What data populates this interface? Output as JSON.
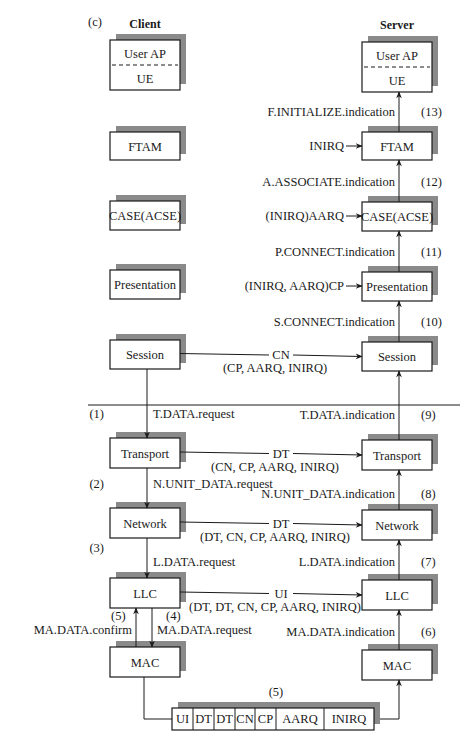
{
  "figure_label": "(c)",
  "columns": {
    "client": {
      "title": "Client",
      "x": 110,
      "w": 70
    },
    "server": {
      "title": "Server",
      "x": 362,
      "w": 70
    }
  },
  "layers": [
    {
      "id": "user-ap",
      "label": "User AP",
      "sub": "UE",
      "cy": 40,
      "sy": 42,
      "h": 50
    },
    {
      "id": "ftam",
      "label": "FTAM",
      "cy": 132,
      "sy": 132,
      "h": 28
    },
    {
      "id": "case",
      "label": "CASE(ACSE)",
      "cy": 201,
      "sy": 202,
      "h": 29
    },
    {
      "id": "presentation",
      "label": "Presentation",
      "cy": 270,
      "sy": 272,
      "h": 29
    },
    {
      "id": "session",
      "label": "Session",
      "cy": 340,
      "sy": 342,
      "h": 29
    },
    {
      "id": "transport",
      "label": "Transport",
      "cy": 438,
      "sy": 440,
      "h": 30
    },
    {
      "id": "network",
      "label": "Network",
      "cy": 508,
      "sy": 510,
      "h": 30
    },
    {
      "id": "llc",
      "label": "LLC",
      "cy": 578,
      "sy": 580,
      "h": 30
    },
    {
      "id": "mac",
      "label": "MAC",
      "cy": 647,
      "sy": 650,
      "h": 30
    }
  ],
  "server_primitives": [
    {
      "label": "F.INITIALIZE.indication",
      "step": "(13)",
      "y": 116
    },
    {
      "label": "A.ASSOCIATE.indication",
      "step": "(12)",
      "y": 186
    },
    {
      "label": "P.CONNECT.indication",
      "step": "(11)",
      "y": 256
    },
    {
      "label": "S.CONNECT.indication",
      "step": "(10)",
      "y": 326
    },
    {
      "label": "T.DATA.indication",
      "step": "(9)",
      "y": 419
    },
    {
      "label": "N.UNIT_DATA.indication",
      "step": "(8)",
      "y": 498
    },
    {
      "label": "L.DATA.indication",
      "step": "(7)",
      "y": 566
    },
    {
      "label": "MA.DATA.indication",
      "step": "(6)",
      "y": 636
    }
  ],
  "server_inputs": [
    {
      "label": "INIRQ",
      "layer": "ftam",
      "y": 150
    },
    {
      "label": "(INIRQ)AARQ",
      "layer": "case",
      "y": 220
    },
    {
      "label": "(INIRQ, AARQ)CP",
      "layer": "presentation",
      "y": 290
    }
  ],
  "client_primitives": [
    {
      "label": "T.DATA.request",
      "step": "(1)",
      "y": 418
    },
    {
      "label": "N.UNIT_DATA.request",
      "step": "(2)",
      "y": 488
    },
    {
      "label": "L.DATA.request",
      "step": "(3)",
      "y": 566
    }
  ],
  "mac_primitives": {
    "confirm": {
      "label": "MA.DATA.confirm",
      "step": "(5)"
    },
    "request": {
      "label": "MA.DATA.request",
      "step": "(4)"
    }
  },
  "peer_pdus": [
    {
      "layer": "session",
      "pdu": "CN",
      "contents": "(CP, AARQ, INIRQ)"
    },
    {
      "layer": "transport",
      "pdu": "DT",
      "contents": "(CN, CP, AARQ, INIRQ)"
    },
    {
      "layer": "network",
      "pdu": "DT",
      "contents": "(DT, CN, CP, AARQ, INIRQ)"
    },
    {
      "layer": "llc",
      "pdu": "UI",
      "contents": "(DT, DT, CN, CP, AARQ, INIRQ)"
    }
  ],
  "frame": {
    "step": "(5)",
    "fields": [
      "UI",
      "DT",
      "DT",
      "CN",
      "CP",
      "AARQ",
      "INIRQ"
    ],
    "widths": [
      21,
      21,
      21,
      20,
      21,
      48,
      50
    ]
  },
  "colors": {
    "ink": "#1a1a1a",
    "shadow": "#8a8a8a",
    "background": "#ffffff"
  }
}
